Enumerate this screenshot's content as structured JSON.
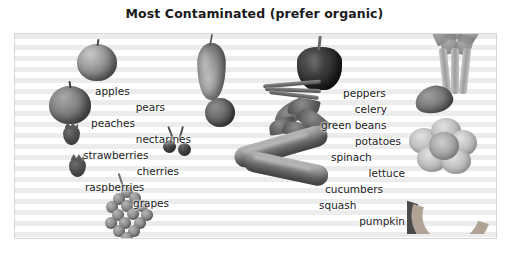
{
  "title": "Most Contaminated (prefer organic)",
  "panel": {
    "background_style": "horizontal-stripes",
    "stripe_color": "#ececed",
    "base_color": "#ffffff",
    "border_color": "#d6d6d6"
  },
  "columns": {
    "left": {
      "items": [
        {
          "label": "apples",
          "x": 80,
          "y": 58,
          "align": "left"
        },
        {
          "label": "pears",
          "x": 60,
          "y": 74,
          "align": "right"
        },
        {
          "label": "peaches",
          "x": 76,
          "y": 90,
          "align": "left"
        },
        {
          "label": "nectarines",
          "x": 56,
          "y": 106,
          "align": "right"
        },
        {
          "label": "strawberries",
          "x": 68,
          "y": 122,
          "align": "left"
        },
        {
          "label": "cherries",
          "x": 60,
          "y": 138,
          "align": "right"
        },
        {
          "label": "raspberries",
          "x": 70,
          "y": 154,
          "align": "left"
        },
        {
          "label": "grapes",
          "x": 66,
          "y": 170,
          "align": "right"
        }
      ]
    },
    "right": {
      "items": [
        {
          "label": "peppers",
          "x": 330,
          "y": 60,
          "align": "left"
        },
        {
          "label": "celery",
          "x": 310,
          "y": 76,
          "align": "right"
        },
        {
          "label": "green beans",
          "x": 318,
          "y": 92,
          "align": "left"
        },
        {
          "label": "potatoes",
          "x": 314,
          "y": 108,
          "align": "right"
        },
        {
          "label": "spinach",
          "x": 320,
          "y": 124,
          "align": "left"
        },
        {
          "label": "lettuce",
          "x": 316,
          "y": 140,
          "align": "right"
        },
        {
          "label": "cucumbers",
          "x": 318,
          "y": 156,
          "align": "left"
        },
        {
          "label": "squash",
          "x": 320,
          "y": 172,
          "align": "left"
        },
        {
          "label": "pumpkin",
          "x": 316,
          "y": 188,
          "align": "right"
        }
      ]
    }
  },
  "illustrations": [
    {
      "name": "apple",
      "depicts": "apple"
    },
    {
      "name": "pear",
      "depicts": "pear"
    },
    {
      "name": "peach",
      "depicts": "peach"
    },
    {
      "name": "nectarine",
      "depicts": "nectarine"
    },
    {
      "name": "strawberry",
      "depicts": "strawberry"
    },
    {
      "name": "cherries",
      "depicts": "cherries"
    },
    {
      "name": "raspberry",
      "depicts": "raspberry"
    },
    {
      "name": "grapes",
      "depicts": "grape-bunch"
    },
    {
      "name": "pepper",
      "depicts": "bell-pepper"
    },
    {
      "name": "celery",
      "depicts": "celery-stalks"
    },
    {
      "name": "green-beans",
      "depicts": "green-beans"
    },
    {
      "name": "potato",
      "depicts": "potato"
    },
    {
      "name": "spinach",
      "depicts": "spinach-leaves"
    },
    {
      "name": "lettuce",
      "depicts": "lettuce-head"
    },
    {
      "name": "cucumber",
      "depicts": "cucumber"
    },
    {
      "name": "squash",
      "depicts": "squash"
    },
    {
      "name": "pumpkin",
      "depicts": "pumpkin-slice"
    }
  ]
}
